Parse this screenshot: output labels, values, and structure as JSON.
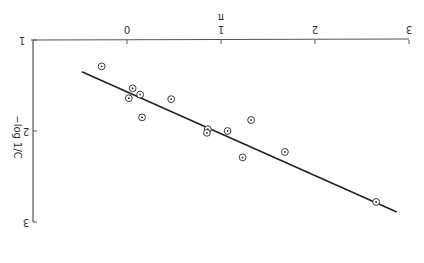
{
  "chart_data": {
    "type": "scatter",
    "orientation_note": "figure rendered upside down (rotated 180 degrees)",
    "title": "",
    "xlabel": "π",
    "ylabel": "−log 1/C",
    "xlim": [
      0,
      3
    ],
    "ylim": [
      1,
      3
    ],
    "x_ticks": [
      "0",
      "1",
      "2",
      "3"
    ],
    "y_ticks": [
      "1",
      "2",
      "3"
    ],
    "grid": false,
    "legend": null,
    "points": [
      {
        "x": -0.27,
        "y": 1.29
      },
      {
        "x": 0.06,
        "y": 1.53
      },
      {
        "x": 0.14,
        "y": 1.6
      },
      {
        "x": 0.02,
        "y": 1.64
      },
      {
        "x": 0.47,
        "y": 1.65
      },
      {
        "x": 0.16,
        "y": 1.85
      },
      {
        "x": 0.86,
        "y": 1.98
      },
      {
        "x": 0.85,
        "y": 2.02
      },
      {
        "x": 1.07,
        "y": 2.0
      },
      {
        "x": 1.32,
        "y": 1.88
      },
      {
        "x": 1.23,
        "y": 2.29
      },
      {
        "x": 1.68,
        "y": 2.23
      },
      {
        "x": 2.65,
        "y": 2.78
      }
    ],
    "fit_line": {
      "x1": -0.48,
      "y1": 1.35,
      "x2": 2.87,
      "y2": 2.89
    },
    "marker": "circle-with-dot",
    "colors": {
      "ink": "#222222",
      "axis": "#555555"
    }
  }
}
